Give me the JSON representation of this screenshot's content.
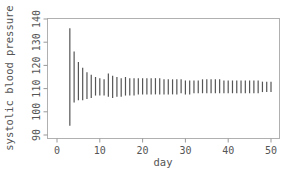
{
  "chart_data": {
    "type": "line",
    "subtype": "vertical-interval-segments",
    "title": "",
    "xlabel": "day",
    "ylabel": "systolic blood pressure",
    "xlim": [
      -2,
      52
    ],
    "ylim": [
      88,
      141
    ],
    "xticks": [
      0,
      10,
      20,
      30,
      40,
      50
    ],
    "yticks": [
      90,
      100,
      110,
      120,
      130,
      140
    ],
    "grid": false,
    "legend": "none",
    "intervals": [
      {
        "day": 3,
        "low": 94,
        "high": 136
      },
      {
        "day": 4,
        "low": 104,
        "high": 126
      },
      {
        "day": 5,
        "low": 105,
        "high": 121.5
      },
      {
        "day": 6,
        "low": 105,
        "high": 119
      },
      {
        "day": 7,
        "low": 105.5,
        "high": 117
      },
      {
        "day": 8,
        "low": 106,
        "high": 116
      },
      {
        "day": 9,
        "low": 107,
        "high": 115
      },
      {
        "day": 10,
        "low": 107,
        "high": 114.5
      },
      {
        "day": 11,
        "low": 107,
        "high": 114
      },
      {
        "day": 12,
        "low": 106.5,
        "high": 116.5
      },
      {
        "day": 13,
        "low": 106,
        "high": 115.5
      },
      {
        "day": 14,
        "low": 106.5,
        "high": 115
      },
      {
        "day": 15,
        "low": 106.5,
        "high": 114.5
      },
      {
        "day": 16,
        "low": 107,
        "high": 115
      },
      {
        "day": 17,
        "low": 107,
        "high": 114.5
      },
      {
        "day": 18,
        "low": 107,
        "high": 114.5
      },
      {
        "day": 19,
        "low": 107.5,
        "high": 114.5
      },
      {
        "day": 20,
        "low": 107.5,
        "high": 114.5
      },
      {
        "day": 21,
        "low": 107.5,
        "high": 114.5
      },
      {
        "day": 22,
        "low": 107.5,
        "high": 114.5
      },
      {
        "day": 23,
        "low": 107.5,
        "high": 114.5
      },
      {
        "day": 24,
        "low": 107.5,
        "high": 114.5
      },
      {
        "day": 25,
        "low": 107.5,
        "high": 114
      },
      {
        "day": 26,
        "low": 107.5,
        "high": 114
      },
      {
        "day": 27,
        "low": 107.5,
        "high": 114
      },
      {
        "day": 28,
        "low": 107.5,
        "high": 114
      },
      {
        "day": 29,
        "low": 108,
        "high": 114
      },
      {
        "day": 30,
        "low": 107.5,
        "high": 113.5
      },
      {
        "day": 31,
        "low": 107.5,
        "high": 113.5
      },
      {
        "day": 32,
        "low": 108,
        "high": 113.5
      },
      {
        "day": 33,
        "low": 108,
        "high": 113.5
      },
      {
        "day": 34,
        "low": 108,
        "high": 114
      },
      {
        "day": 35,
        "low": 108,
        "high": 114
      },
      {
        "day": 36,
        "low": 108,
        "high": 114
      },
      {
        "day": 37,
        "low": 108,
        "high": 114
      },
      {
        "day": 38,
        "low": 108,
        "high": 114
      },
      {
        "day": 39,
        "low": 108,
        "high": 113.5
      },
      {
        "day": 40,
        "low": 108,
        "high": 113.5
      },
      {
        "day": 41,
        "low": 108,
        "high": 113.5
      },
      {
        "day": 42,
        "low": 108,
        "high": 113.5
      },
      {
        "day": 43,
        "low": 108,
        "high": 113.5
      },
      {
        "day": 44,
        "low": 108,
        "high": 113.5
      },
      {
        "day": 45,
        "low": 108,
        "high": 113.5
      },
      {
        "day": 46,
        "low": 108,
        "high": 113.5
      },
      {
        "day": 47,
        "low": 108,
        "high": 113.5
      },
      {
        "day": 48,
        "low": 108.5,
        "high": 113
      },
      {
        "day": 49,
        "low": 108.5,
        "high": 113
      },
      {
        "day": 50,
        "low": 108.5,
        "high": 113
      }
    ],
    "colors": {
      "segments": "#555555",
      "frame": "#b0b0b0",
      "text": "#555555"
    }
  }
}
